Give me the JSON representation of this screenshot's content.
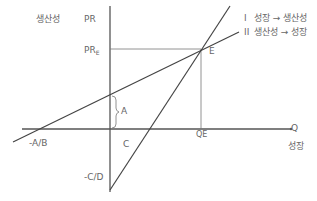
{
  "diagram": {
    "y_axis": {
      "title": "생산성",
      "symbol": "PR"
    },
    "x_axis": {
      "title": "성장",
      "symbol": "Q"
    },
    "pr_e_label": "PR",
    "pr_e_sub": "E",
    "qe_label": "QE",
    "equilibrium_label": "E",
    "intercept_labels": {
      "a": "A",
      "c": "C",
      "neg_a_over_b": "-A/B",
      "neg_c_over_d": "-C/D"
    },
    "legend": [
      {
        "numeral": "I",
        "text": "성장 → 생산성"
      },
      {
        "numeral": "II",
        "text": "생산성 → 성장"
      }
    ],
    "colors": {
      "line": "#444444",
      "guide": "#666666",
      "text": "#666666"
    }
  }
}
